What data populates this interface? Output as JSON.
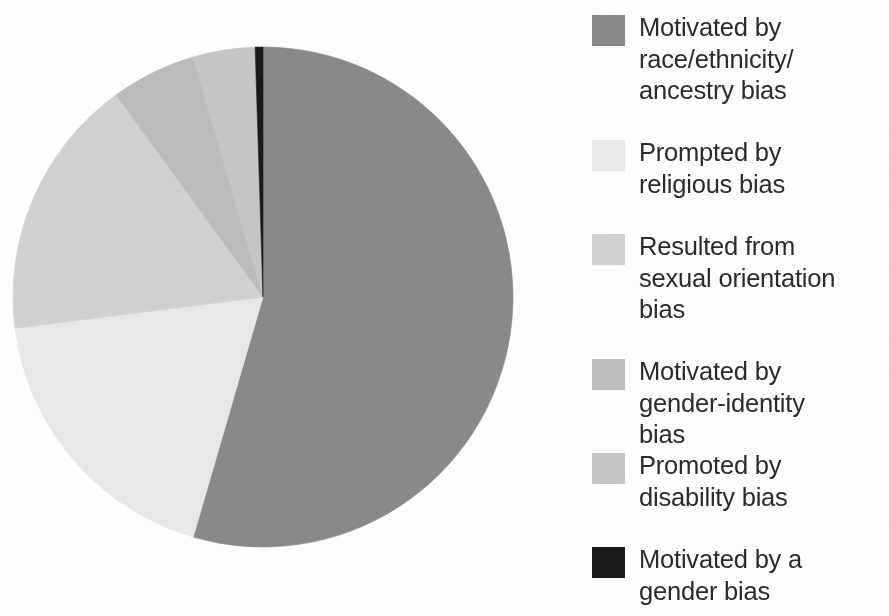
{
  "figure": {
    "background_color": "#ffffff",
    "text_color": "#2b2b2b"
  },
  "legend": {
    "position": "right",
    "items": [
      {
        "label": "Motivated by\nrace/ethnicity/\nancestry bias",
        "color": "#8a8a8a",
        "top": 12,
        "swatch_name": "legend-swatch-race-ethnicity-ancestry"
      },
      {
        "label": "Prompted by\nreligious bias",
        "color": "#e9e9e9",
        "top": 137,
        "swatch_name": "legend-swatch-religious"
      },
      {
        "label": "Resulted from\nsexual orientation\nbias",
        "color": "#d2d2d2",
        "top": 231,
        "swatch_name": "legend-swatch-sexual-orientation"
      },
      {
        "label": "Motivated by\ngender-identity\nbias",
        "color": "#bdbdbd",
        "top": 356,
        "swatch_name": "legend-swatch-gender-identity"
      },
      {
        "label": "Promoted by\ndisability bias",
        "color": "#c7c7c7",
        "top": 450,
        "swatch_name": "legend-swatch-disability"
      },
      {
        "label": "Motivated by a\ngender bias",
        "color": "#1a1a1a",
        "top": 544,
        "swatch_name": "legend-swatch-gender"
      }
    ]
  },
  "chart_data": {
    "type": "pie",
    "title": "",
    "subtitle": "",
    "xlabel": "",
    "ylabel": "",
    "grid": false,
    "legend_position": "right",
    "start_angle_deg": 0,
    "direction": "clockwise",
    "center": {
      "x": 263,
      "y": 297
    },
    "radius": 250,
    "labels": [
      "Motivated by race/ethnicity/ancestry bias",
      "Prompted by religious bias",
      "Resulted from sexual orientation bias",
      "Motivated by gender-identity bias",
      "Promoted by disability bias",
      "Motivated by a gender bias"
    ],
    "values": [
      54.5,
      18.5,
      17.0,
      5.5,
      4.0,
      0.5
    ],
    "units": "percent",
    "colors": [
      "#8a8a8a",
      "#e9e9e9",
      "#d2d2d2",
      "#bdbdbd",
      "#c7c7c7",
      "#1a1a1a"
    ],
    "slices": [
      {
        "label": "Motivated by race/ethnicity/ancestry bias",
        "value": 54.5,
        "angle_deg": 196.2,
        "color": "#8a8a8a"
      },
      {
        "label": "Prompted by religious bias",
        "value": 18.5,
        "angle_deg": 66.6,
        "color": "#e9e9e9"
      },
      {
        "label": "Resulted from sexual orientation bias",
        "value": 17.0,
        "angle_deg": 61.2,
        "color": "#d2d2d2"
      },
      {
        "label": "Motivated by gender-identity bias",
        "value": 5.5,
        "angle_deg": 19.8,
        "color": "#bdbdbd"
      },
      {
        "label": "Promoted by disability bias",
        "value": 4.0,
        "angle_deg": 14.4,
        "color": "#c7c7c7"
      },
      {
        "label": "Motivated by a gender bias",
        "value": 0.5,
        "angle_deg": 1.8,
        "color": "#1a1a1a"
      }
    ]
  }
}
